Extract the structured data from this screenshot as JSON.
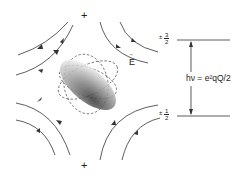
{
  "diagram": {
    "charges": {
      "top": "+",
      "bottom": "+"
    },
    "field_label": "E",
    "field_label_arrow": "→",
    "levels": {
      "upper": {
        "sign": "±",
        "numerator": "3",
        "denominator": "2"
      },
      "lower": {
        "sign": "±",
        "numerator": "1",
        "denominator": "2"
      }
    },
    "transition_label": "hν = e²qQ/2",
    "colors": {
      "line": "#333333",
      "stipple": "#555555"
    }
  }
}
